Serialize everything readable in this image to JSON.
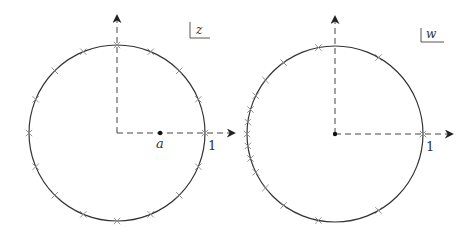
{
  "panels": [
    {
      "id": "z-plane",
      "plane_label": "z",
      "center": [
        117,
        133
      ],
      "radius": 88,
      "marked_point_label": "a",
      "marked_point_x": 0.49,
      "unit_label": "1",
      "marks_count": 16,
      "mapping": "identity"
    },
    {
      "id": "w-plane",
      "plane_label": "w",
      "center": [
        335,
        134
      ],
      "radius": 88,
      "unit_label": "1",
      "marks_count": 16,
      "mapping": "mobius",
      "mobius_a": 0.49
    }
  ],
  "colors": {
    "circle": "#333333",
    "axis": "#444444",
    "mark": "#888888",
    "text": "#333333"
  }
}
